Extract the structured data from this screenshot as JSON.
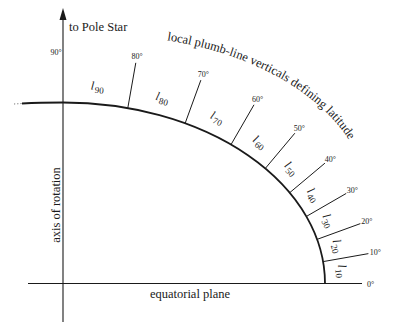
{
  "diagram": {
    "top_label": "to Pole Star",
    "curve_label": "local plumb-line verticals defining latitude",
    "axis_label": "axis of rotation",
    "plane_label": "equatorial plane",
    "pole_degree": "90°",
    "equator_degree": "0°",
    "ticks": [
      {
        "deg": 80,
        "label": "80°"
      },
      {
        "deg": 70,
        "label": "70°"
      },
      {
        "deg": 60,
        "label": "60°"
      },
      {
        "deg": 50,
        "label": "50°"
      },
      {
        "deg": 40,
        "label": "40°"
      },
      {
        "deg": 30,
        "label": "30°"
      },
      {
        "deg": 20,
        "label": "20°"
      },
      {
        "deg": 10,
        "label": "10°"
      }
    ],
    "segments": [
      {
        "main": "l",
        "sub": "90"
      },
      {
        "main": "l",
        "sub": "80"
      },
      {
        "main": "l",
        "sub": "70"
      },
      {
        "main": "l",
        "sub": "60"
      },
      {
        "main": "l",
        "sub": "50"
      },
      {
        "main": "l",
        "sub": "40"
      },
      {
        "main": "l",
        "sub": "30"
      },
      {
        "main": "l",
        "sub": "20"
      },
      {
        "main": "l",
        "sub": "10"
      }
    ],
    "colors": {
      "ink": "#1a1a1a",
      "background": "#ffffff"
    }
  }
}
